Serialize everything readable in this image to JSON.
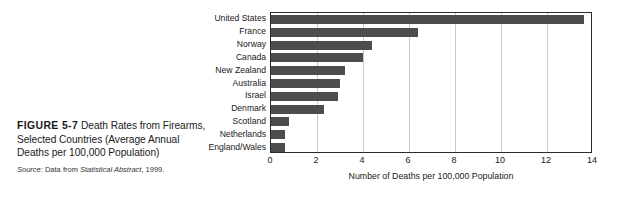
{
  "figure": {
    "label": "FIGURE 5-7",
    "title_text": "Death Rates from Firearms, Selected Countries (Average Annual Deaths per 100,000 Population)",
    "source_prefix": "Source:",
    "source_lead": "Data from",
    "source_title": "Statistical Abstract",
    "source_year": ", 1999."
  },
  "colors": {
    "bar": "#4d4d4d",
    "frame": "#2b2b2b",
    "gridline": "#c9c9c9",
    "text": "#1a1a1a",
    "background": "#ffffff"
  },
  "chart_data": {
    "type": "bar",
    "orientation": "horizontal",
    "title": "",
    "xlabel": "Number of Deaths per 100,000 Population",
    "ylabel": "",
    "xlim": [
      0,
      14
    ],
    "xticks": [
      0,
      2,
      4,
      6,
      8,
      10,
      12,
      14
    ],
    "xtick_labels": [
      "0",
      "2",
      "4",
      "6",
      "8",
      "10",
      "12",
      "14"
    ],
    "grid": "vertical",
    "legend": "none",
    "categories": [
      "United States",
      "France",
      "Norway",
      "Canada",
      "New Zealand",
      "Australia",
      "Israel",
      "Denmark",
      "Scotland",
      "Netherlands",
      "England/Wales"
    ],
    "values": [
      13.6,
      6.4,
      4.4,
      4.0,
      3.2,
      3.0,
      2.9,
      2.3,
      0.8,
      0.6,
      0.6
    ]
  }
}
